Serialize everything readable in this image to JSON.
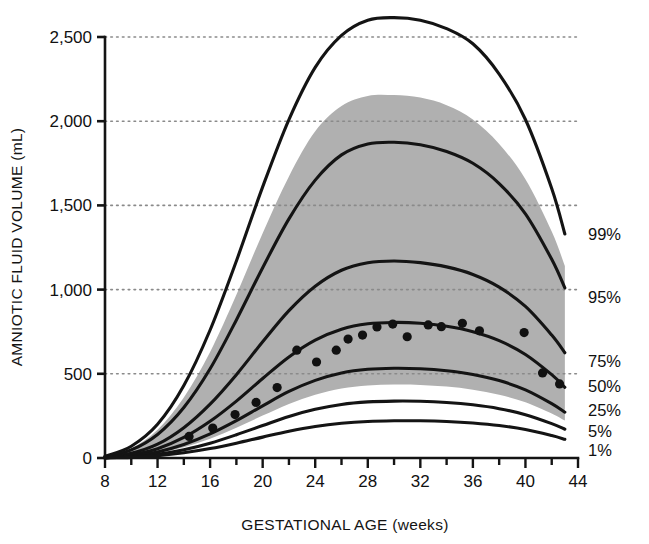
{
  "chart_data": {
    "type": "line",
    "title": "",
    "xlabel": "GESTATIONAL AGE (weeks)",
    "ylabel": "AMNIOTIC FLUID VOLUME (mL)",
    "xlim": [
      8,
      44
    ],
    "ylim": [
      0,
      2500
    ],
    "xticks": [
      8,
      12,
      16,
      20,
      24,
      28,
      32,
      36,
      40,
      44
    ],
    "xtick_labels": [
      "8",
      "12",
      "16",
      "20",
      "24",
      "28",
      "32",
      "36",
      "40",
      "44"
    ],
    "xminor_step": 2,
    "yticks": [
      0,
      500,
      1000,
      1500,
      2000,
      2500
    ],
    "ytick_labels": [
      "0",
      "500",
      "1,000",
      "1,500",
      "2,000",
      "2,500"
    ],
    "grid": "horizontal-dotted",
    "legend_position": "right-of-curve-ends",
    "colors": {
      "curve": "#141414",
      "band_fill": "#b0b0b0",
      "dot": "#111111",
      "gridline": "#8a8a8a",
      "axis": "#141414",
      "background": "#ffffff"
    },
    "x": [
      8,
      10,
      12,
      14,
      16,
      18,
      20,
      22,
      24,
      26,
      28,
      30,
      32,
      34,
      36,
      38,
      40,
      42,
      43
    ],
    "series": [
      {
        "name": "99%",
        "label": "99%",
        "values": [
          10,
          70,
          200,
          430,
          760,
          1170,
          1610,
          2010,
          2320,
          2510,
          2600,
          2615,
          2600,
          2550,
          2460,
          2280,
          2010,
          1600,
          1330
        ]
      },
      {
        "name": "95%",
        "label": "95%",
        "values": [
          8,
          48,
          140,
          300,
          530,
          820,
          1130,
          1420,
          1650,
          1800,
          1865,
          1875,
          1860,
          1820,
          1750,
          1630,
          1450,
          1180,
          1010
        ]
      },
      {
        "name": "75%",
        "label": "75%",
        "values": [
          5,
          28,
          82,
          180,
          320,
          495,
          690,
          875,
          1020,
          1115,
          1160,
          1170,
          1160,
          1135,
          1090,
          1015,
          900,
          730,
          625
        ]
      },
      {
        "name": "50%",
        "label": "50%",
        "values": [
          3,
          18,
          55,
          122,
          218,
          338,
          472,
          600,
          700,
          765,
          797,
          805,
          800,
          782,
          750,
          697,
          615,
          495,
          420
        ]
      },
      {
        "name": "25%",
        "label": "25%",
        "values": [
          2,
          12,
          36,
          80,
          143,
          222,
          310,
          395,
          461,
          505,
          527,
          533,
          530,
          518,
          496,
          460,
          405,
          323,
          272
        ]
      },
      {
        "name": "5%",
        "label": "5%",
        "values": [
          1,
          7,
          22,
          49,
          88,
          138,
          193,
          247,
          289,
          318,
          333,
          338,
          337,
          330,
          316,
          293,
          257,
          204,
          171
        ]
      },
      {
        "name": "1%",
        "label": "1%",
        "values": [
          1,
          4,
          14,
          31,
          56,
          88,
          124,
          159,
          187,
          206,
          217,
          221,
          221,
          217,
          208,
          193,
          169,
          133,
          111
        ]
      }
    ],
    "band": {
      "name": "reference-range-shaded",
      "x": [
        8,
        10,
        12,
        14,
        16,
        18,
        20,
        22,
        24,
        26,
        28,
        30,
        32,
        34,
        36,
        38,
        40,
        42,
        43
      ],
      "upper": [
        9,
        57,
        168,
        360,
        630,
        970,
        1335,
        1672,
        1940,
        2090,
        2150,
        2155,
        2140,
        2095,
        2010,
        1865,
        1655,
        1345,
        1140
      ],
      "lower": [
        1,
        9,
        29,
        64,
        115,
        180,
        252,
        321,
        375,
        412,
        430,
        436,
        434,
        424,
        406,
        376,
        331,
        264,
        222
      ]
    },
    "scatter": {
      "name": "observed-means",
      "marker": "filled-circle",
      "points": [
        {
          "x": 14.4,
          "y": 128
        },
        {
          "x": 16.2,
          "y": 178
        },
        {
          "x": 17.9,
          "y": 258
        },
        {
          "x": 19.5,
          "y": 330
        },
        {
          "x": 21.1,
          "y": 418
        },
        {
          "x": 22.6,
          "y": 640
        },
        {
          "x": 24.1,
          "y": 570
        },
        {
          "x": 25.6,
          "y": 640
        },
        {
          "x": 26.5,
          "y": 706
        },
        {
          "x": 27.6,
          "y": 730
        },
        {
          "x": 28.7,
          "y": 778
        },
        {
          "x": 29.9,
          "y": 795
        },
        {
          "x": 31.0,
          "y": 720
        },
        {
          "x": 32.6,
          "y": 790
        },
        {
          "x": 33.6,
          "y": 780
        },
        {
          "x": 35.2,
          "y": 800
        },
        {
          "x": 36.5,
          "y": 755
        },
        {
          "x": 39.9,
          "y": 745
        },
        {
          "x": 41.3,
          "y": 505
        },
        {
          "x": 42.6,
          "y": 440
        }
      ]
    }
  }
}
